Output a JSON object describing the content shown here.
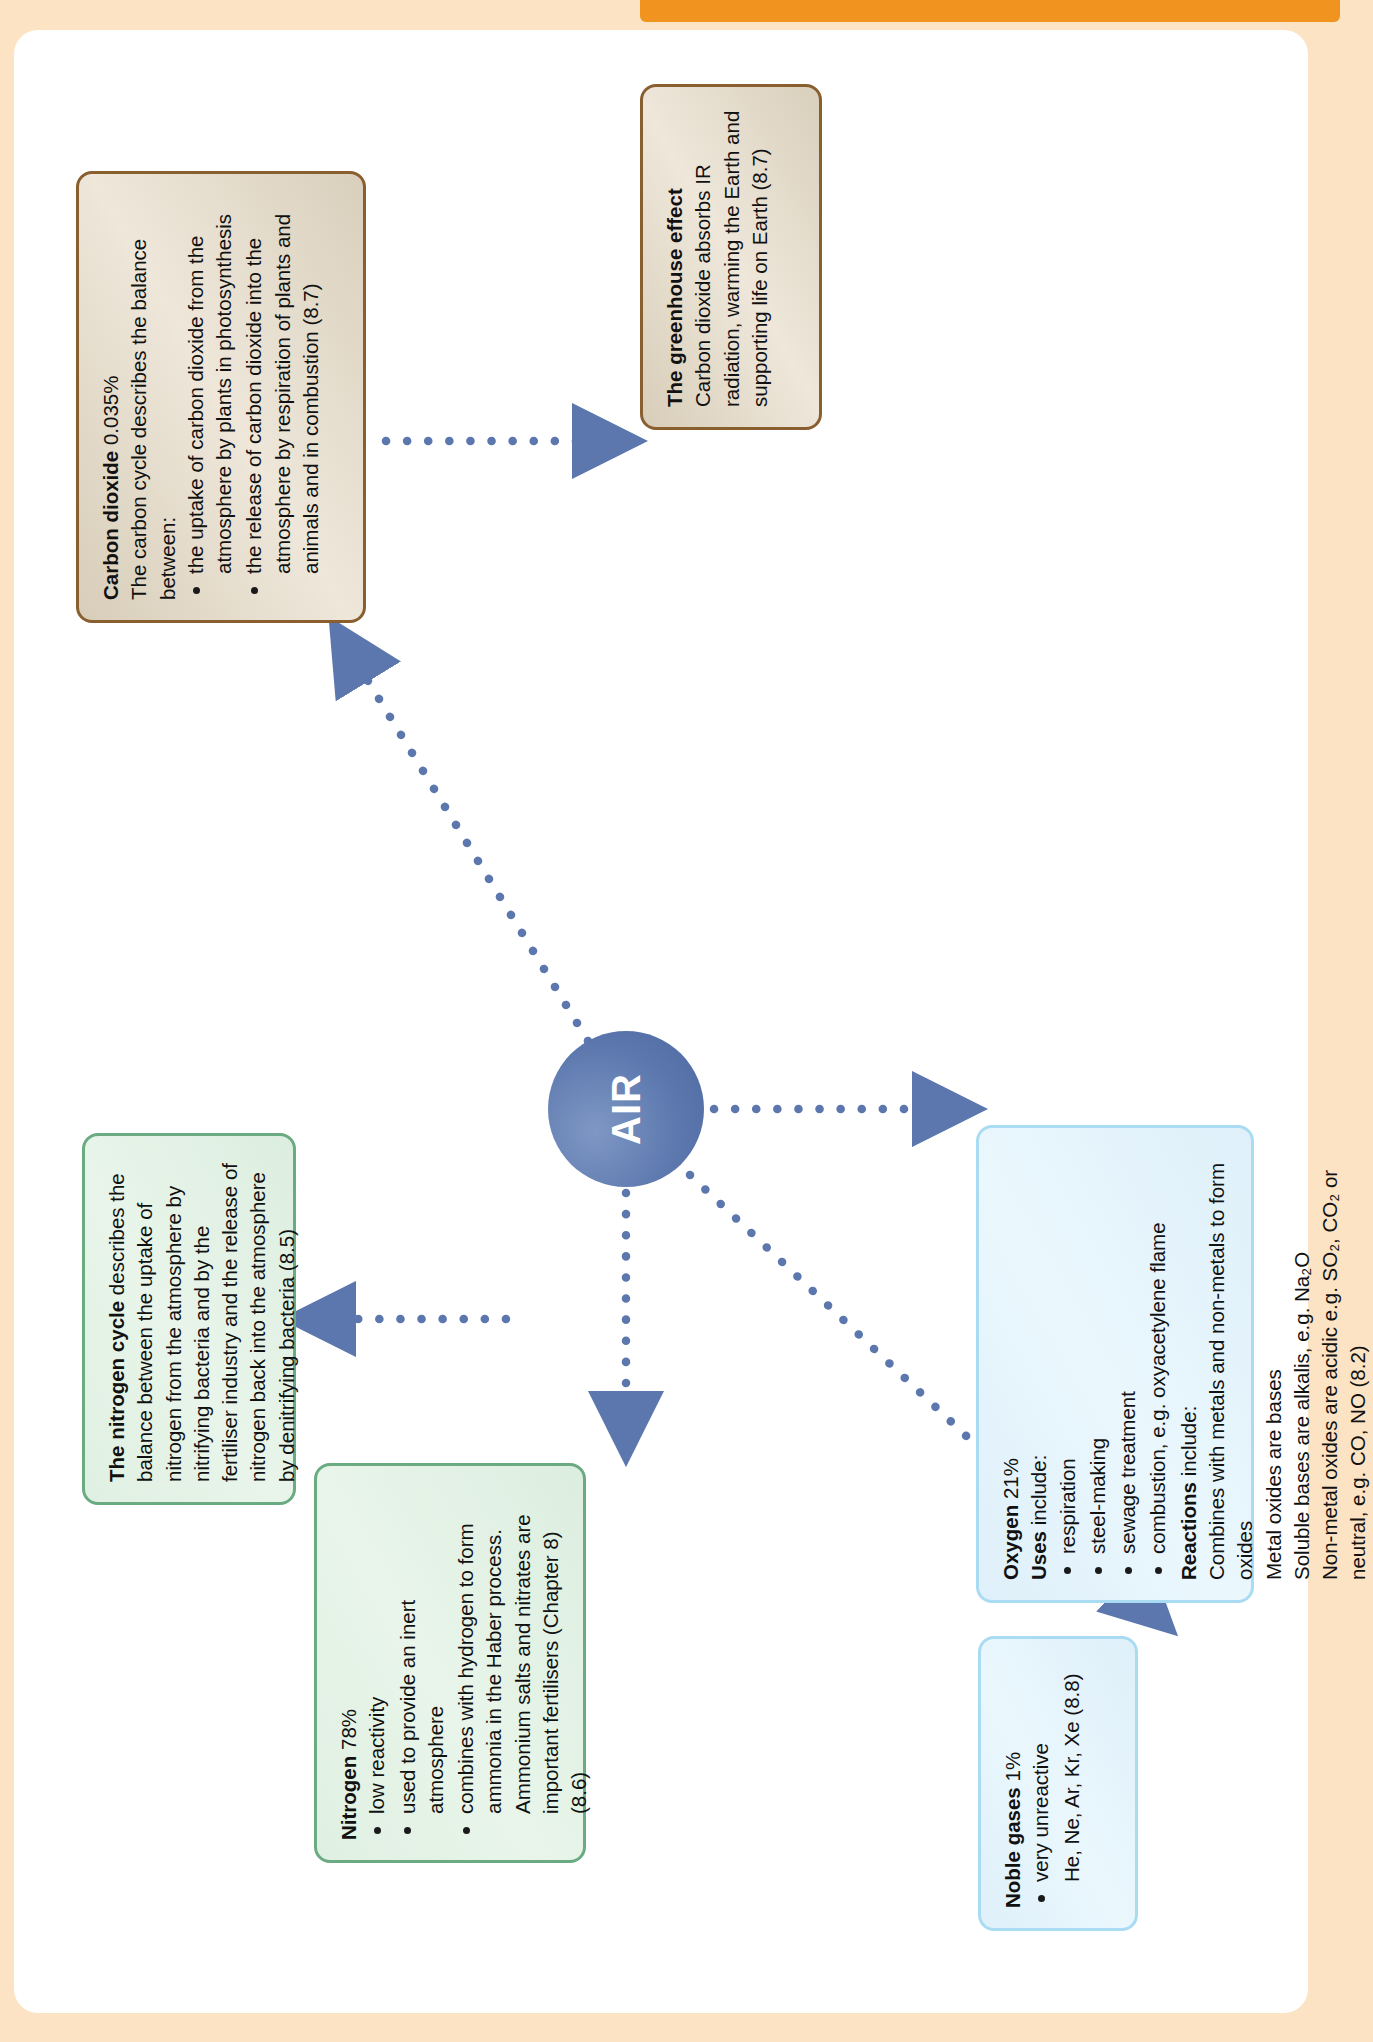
{
  "page": {
    "background_color": "#fbe3c4",
    "paper_color": "#ffffff",
    "tab_color": "#f0941f"
  },
  "center": {
    "label": "AIR",
    "color": "#5b77ad",
    "text_color": "#ffffff"
  },
  "nodes": {
    "nitrogen_cycle": {
      "accent": "#6aab82",
      "title": "The nitrogen cycle",
      "title_rest": " describes the",
      "body": "balance between the uptake of nitrogen from the atmosphere by nitrifying bacteria and by the fertiliser industry and the release of nitrogen back into the atmosphere by denitrifying bacteria (8.5)"
    },
    "nitrogen": {
      "accent": "#6aab82",
      "title": "Nitrogen",
      "title_rest": " 78%",
      "bullets": [
        "low reactivity",
        "used to provide an inert atmosphere",
        "combines with hydrogen to form ammonia in the Haber process. Ammonium salts and nitrates are important fertilisers (Chapter 8) (8.6)"
      ]
    },
    "noble_gases": {
      "accent": "#a9dcf2",
      "title": "Noble gases",
      "title_rest": " 1%",
      "bullets": [
        "very unreactive"
      ],
      "extra": "He, Ne, Ar, Kr, Xe (8.8)"
    },
    "oxygen": {
      "accent": "#a9dcf2",
      "title": "Oxygen",
      "title_rest": " 21%",
      "uses_label": "Uses",
      "uses_rest": " include:",
      "uses": [
        "respiration",
        "steel-making",
        "sewage treatment",
        "combustion, e.g. oxyacetylene flame"
      ],
      "reactions_label": "Reactions",
      "reactions_rest": " include:",
      "reactions": [
        "Combines with metals and non-metals to form oxides",
        "Metal oxides are bases",
        "Soluble bases are alkalis, e.g. Na₂O",
        "Non-metal oxides are acidic e.g. SO₂, CO₂ or neutral, e.g. CO, NO (8.2)"
      ]
    },
    "carbon_dioxide": {
      "accent": "#8a5f30",
      "title": "Carbon dioxide",
      "title_rest": " 0.035%",
      "intro": "The carbon cycle describes the balance between:",
      "bullets": [
        "the uptake of carbon dioxide from the atmosphere by plants in photosynthesis",
        "the release of carbon dioxide into the atmosphere by respiration of plants and animals and in combustion (8.7)"
      ]
    },
    "greenhouse": {
      "accent": "#8a5f30",
      "title": "The greenhouse effect",
      "body": "Carbon dioxide absorbs IR radiation, warming the Earth and supporting life on Earth (8.7)"
    }
  },
  "connector": {
    "color": "#5b77ad",
    "style": "dotted"
  }
}
